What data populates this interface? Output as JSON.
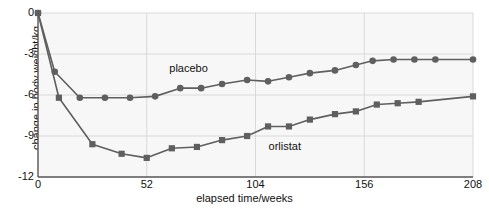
{
  "chart_data": {
    "type": "line",
    "title": "",
    "xlabel": "elapsed time/weeks",
    "ylabel": "change in body weight/kg",
    "xlim": [
      0,
      208
    ],
    "ylim": [
      -12,
      0
    ],
    "xticks": [
      "0",
      "52",
      "104",
      "156",
      "208"
    ],
    "yticks": [
      "0",
      "-3",
      "-6",
      "-9",
      "-12"
    ],
    "grid": true,
    "legend_position": "inline-annotation",
    "colors": {
      "placebo": "#5f5f5f",
      "orlistat": "#5f5f5f",
      "grid": "#d9d9d9",
      "axis": "#555555",
      "plot_background": "#f7f7f7"
    },
    "series": [
      {
        "name": "placebo",
        "marker": "circle",
        "x": [
          0,
          8,
          20,
          32,
          44,
          56,
          68,
          78,
          88,
          100,
          110,
          120,
          130,
          142,
          152,
          160,
          170,
          180,
          190,
          208
        ],
        "y": [
          0,
          -4.3,
          -6.2,
          -6.2,
          -6.2,
          -6.1,
          -5.5,
          -5.5,
          -5.2,
          -4.9,
          -5.0,
          -4.7,
          -4.4,
          -4.2,
          -3.8,
          -3.5,
          -3.4,
          -3.4,
          -3.4,
          -3.4
        ]
      },
      {
        "name": "orlistat",
        "marker": "square",
        "x": [
          0,
          10,
          26,
          40,
          52,
          64,
          76,
          88,
          100,
          110,
          120,
          130,
          142,
          152,
          162,
          172,
          182,
          208
        ],
        "y": [
          0,
          -6.2,
          -9.6,
          -10.3,
          -10.6,
          -9.9,
          -9.8,
          -9.3,
          -9.0,
          -8.3,
          -8.3,
          -7.8,
          -7.4,
          -7.2,
          -6.7,
          -6.6,
          -6.5,
          -6.1
        ]
      }
    ],
    "annotations": [
      {
        "text": "placebo",
        "x": 72,
        "y": -4.3
      },
      {
        "text": "orlistat",
        "x": 118,
        "y": -10.0
      }
    ]
  }
}
